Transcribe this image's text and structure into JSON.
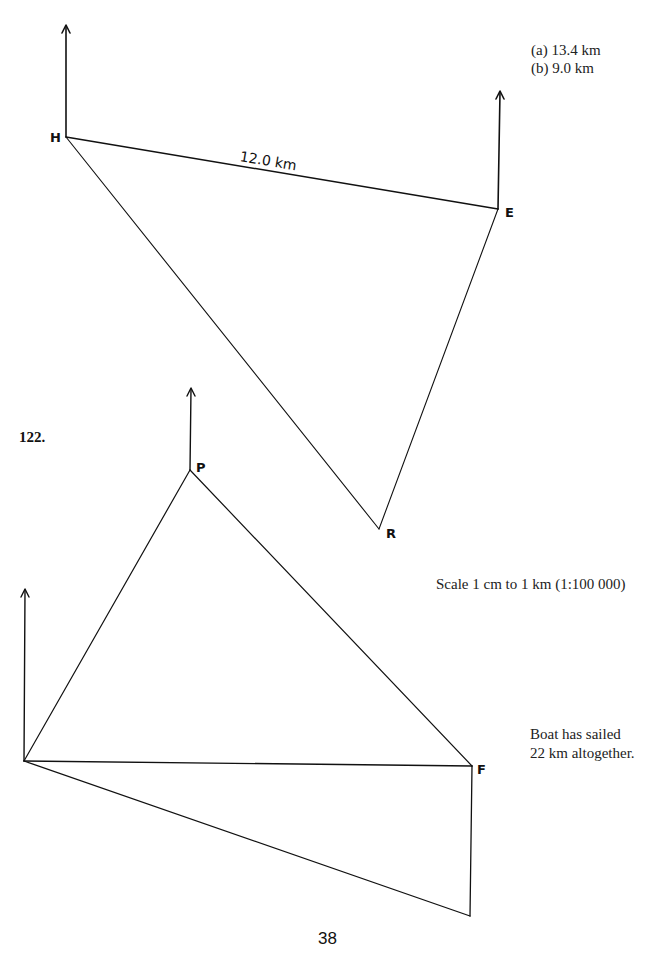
{
  "diagram1": {
    "points": {
      "H": "H",
      "E": "E",
      "R": "R"
    },
    "side_label_HE": "12.0 km",
    "answers": {
      "a": "(a) 13.4 km",
      "b": "(b) 9.0 km"
    }
  },
  "question_number": "122.",
  "diagram2": {
    "points": {
      "P": "P",
      "F": "F"
    },
    "scale": "Scale 1 cm to 1 km (1:100 000)",
    "note_line1": "Boat has sailed",
    "note_line2": "22 km altogether."
  },
  "page_number": "38"
}
